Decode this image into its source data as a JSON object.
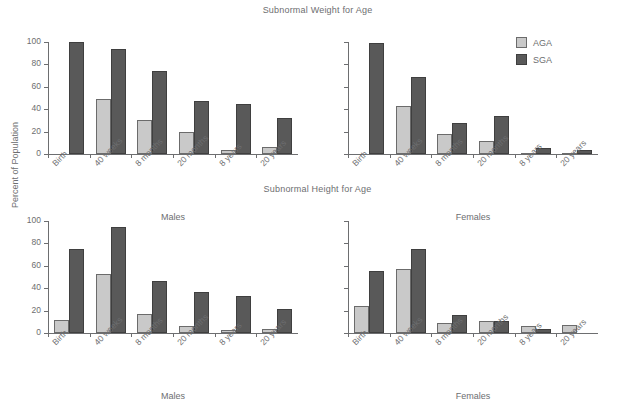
{
  "chart_data": {
    "type": "bar",
    "ylabel": "Percent of Population",
    "ylim": [
      0,
      100
    ],
    "yticks": [
      0,
      20,
      40,
      60,
      80,
      100
    ],
    "grid": false,
    "legend_position": "top-right",
    "legend": [
      {
        "name": "AGA",
        "color": "#c9c9c9"
      },
      {
        "name": "SGA",
        "color": "#595959"
      }
    ],
    "categories": [
      "Birth",
      "40 weeks",
      "8 months",
      "20 months",
      "8 years",
      "20 years"
    ],
    "panels": [
      {
        "title": "Subnormal Weight for Age",
        "xlabel": "Males",
        "y_tick_labels_visible": true,
        "series": [
          {
            "name": "AGA",
            "values": [
              0,
              49,
              30,
              19.5,
              3.5,
              6
            ]
          },
          {
            "name": "SGA",
            "values": [
              100,
              93.5,
              74,
              47,
              45,
              32
            ]
          }
        ]
      },
      {
        "title": "Subnormal Weight for Age",
        "xlabel": "Females",
        "y_tick_labels_visible": false,
        "series": [
          {
            "name": "AGA",
            "values": [
              0,
              43,
              17.5,
              12,
              1,
              0.5
            ]
          },
          {
            "name": "SGA",
            "values": [
              99,
              69,
              28,
              34,
              5,
              4
            ]
          }
        ]
      },
      {
        "title": "Subnormal Height for Age",
        "xlabel": "Males",
        "y_tick_labels_visible": true,
        "series": [
          {
            "name": "AGA",
            "values": [
              12,
              52.5,
              17,
              6.5,
              3,
              4
            ]
          },
          {
            "name": "SGA",
            "values": [
              75,
              94.5,
              46.5,
              37,
              33,
              21
            ]
          }
        ]
      },
      {
        "title": "Subnormal Height for Age",
        "xlabel": "Females",
        "y_tick_labels_visible": false,
        "series": [
          {
            "name": "AGA",
            "values": [
              24,
              57.5,
              9,
              11,
              6,
              7
            ]
          },
          {
            "name": "SGA",
            "values": [
              55,
              75,
              16,
              11,
              4,
              0
            ]
          }
        ]
      }
    ]
  },
  "titles": {
    "weight": "Subnormal Weight for Age",
    "height": "Subnormal Height for Age"
  },
  "axes": {
    "ylabel": "Percent of Population",
    "xlabel_males": "Males",
    "xlabel_females": "Females"
  }
}
